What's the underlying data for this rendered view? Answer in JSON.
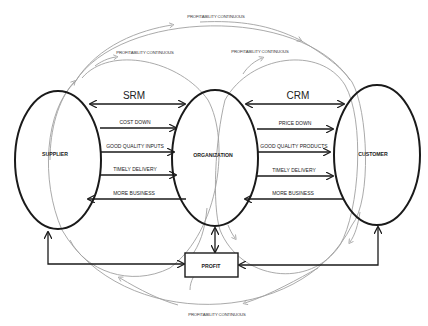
{
  "diagram": {
    "nodes": {
      "supplier": "SUPPLIER",
      "organization": "ORGANIZATION",
      "customer": "CUSTOMER",
      "profit": "PROFIT"
    },
    "groups": {
      "srm": "SRM",
      "crm": "CRM"
    },
    "srm_flows": [
      {
        "label": "COST DOWN",
        "direction": "supplier-to-organization"
      },
      {
        "label": "GOOD QUALITY INPUTS",
        "direction": "supplier-to-organization"
      },
      {
        "label": "TIMELY DELIVERY",
        "direction": "supplier-to-organization"
      },
      {
        "label": "MORE BUSINESS",
        "direction": "organization-to-supplier"
      }
    ],
    "crm_flows": [
      {
        "label": "PRICE DOWN",
        "direction": "organization-to-customer"
      },
      {
        "label": "GOOD QUALITY PRODUCTS",
        "direction": "organization-to-customer"
      },
      {
        "label": "TIMELY DELIVERY",
        "direction": "organization-to-customer"
      },
      {
        "label": "MORE BUSINESS",
        "direction": "customer-to-organization"
      }
    ],
    "cycle_labels": {
      "outer_top": "PROFITABILITY CONTINUOUS",
      "srm_top": "PROFITABILITY CONTINUOUS",
      "crm_top": "PROFITABILITY CONTINUOUS",
      "outer_bottom": "PROFITABILITY CONTINUOUS"
    },
    "colors": {
      "node_stroke": "#1a1a1a",
      "cycle_stroke": "#9a9a9a",
      "background": "#ffffff"
    }
  }
}
